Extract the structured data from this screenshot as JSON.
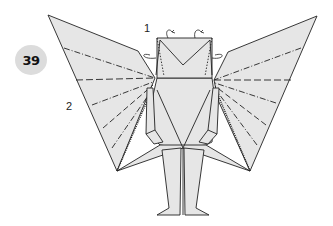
{
  "diagram": {
    "step_number": "39",
    "annotations": [
      {
        "id": "1",
        "text": "1",
        "target": "head corners (valley/mountain fold behind)"
      },
      {
        "id": "2",
        "text": "2",
        "target": "wing pleats"
      }
    ],
    "colors": {
      "paper": "#e6e6e6",
      "line": "#222222",
      "badge": "#dcdcdc",
      "background": "#ffffff"
    },
    "line_types": [
      "solid edge",
      "valley fold (dashed)",
      "mountain fold (dash-dot)",
      "x-ray (dotted)",
      "fold-behind arrow"
    ]
  }
}
